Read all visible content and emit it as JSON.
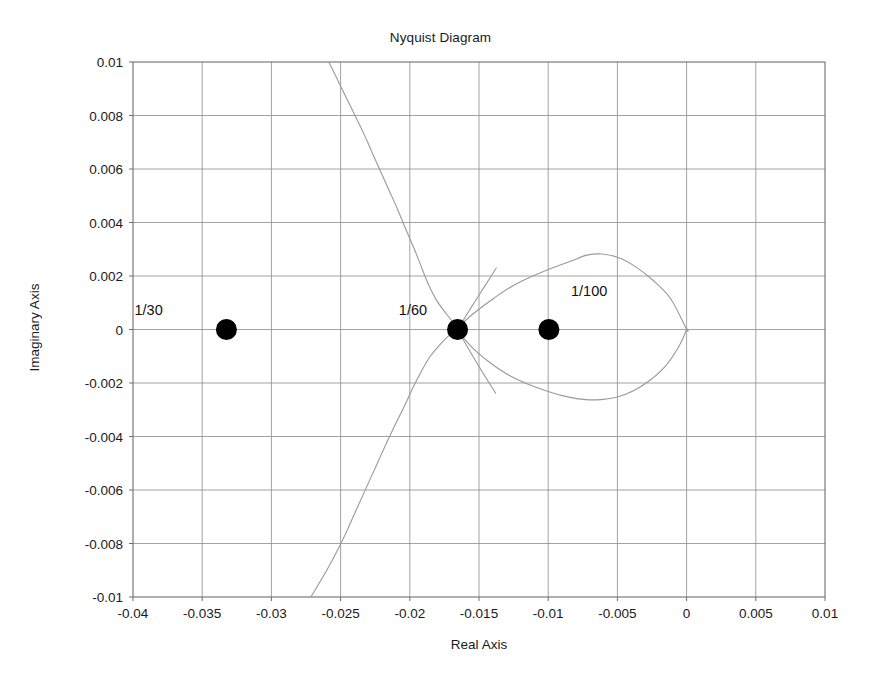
{
  "chart_data": {
    "type": "line",
    "title": "Nyquist Diagram",
    "xlabel": "Real Axis",
    "ylabel": "Imaginary Axis",
    "xlim": [
      -0.04,
      0.01
    ],
    "ylim": [
      -0.01,
      0.01
    ],
    "grid": true,
    "legend": "none",
    "xticks": [
      -0.04,
      -0.035,
      -0.03,
      -0.025,
      -0.02,
      -0.015,
      -0.01,
      -0.005,
      0,
      0.005,
      0.01
    ],
    "xtick_labels": [
      "-0.04",
      "-0.035",
      "-0.03",
      "-0.025",
      "-0.02",
      "-0.015",
      "-0.01",
      "-0.005",
      "0",
      "0.005",
      "0.01"
    ],
    "yticks": [
      0.01,
      0.008,
      0.006,
      0.004,
      0.002,
      0,
      -0.002,
      -0.004,
      -0.006,
      -0.008,
      -0.01
    ],
    "ytick_labels": [
      "0.01",
      "0.008",
      "0.006",
      "0.004",
      "0.002",
      "0",
      "-0.002",
      "-0.004",
      "-0.006",
      "-0.008",
      "-0.01"
    ],
    "line_color": "#999999",
    "marker_color": "#000000",
    "series": [
      {
        "name": "nyquist-loop",
        "closed": true,
        "points": [
          [
            0.0,
            0.0
          ],
          [
            -0.00115,
            0.00115
          ],
          [
            -0.00245,
            0.00185
          ],
          [
            -0.0037,
            0.00235
          ],
          [
            -0.0049,
            0.00268
          ],
          [
            -0.0061,
            0.00282
          ],
          [
            -0.0072,
            0.00278
          ],
          [
            -0.0084,
            0.00255
          ],
          [
            -0.0098,
            0.00228
          ],
          [
            -0.0112,
            0.00198
          ],
          [
            -0.0126,
            0.00162
          ],
          [
            -0.0139,
            0.00118
          ],
          [
            -0.0151,
            0.00072
          ],
          [
            -0.0161,
            0.00028
          ],
          [
            -0.01655,
            0.0
          ],
          [
            -0.0161,
            -0.00032
          ],
          [
            -0.0152,
            -0.00082
          ],
          [
            -0.0141,
            -0.00128
          ],
          [
            -0.0128,
            -0.00172
          ],
          [
            -0.0114,
            -0.00206
          ],
          [
            -0.01,
            -0.00232
          ],
          [
            -0.0086,
            -0.00252
          ],
          [
            -0.0073,
            -0.00262
          ],
          [
            -0.0062,
            -0.00262
          ],
          [
            -0.005,
            -0.00252
          ],
          [
            -0.0038,
            -0.00228
          ],
          [
            -0.0026,
            -0.00188
          ],
          [
            -0.00145,
            -0.00132
          ],
          [
            -0.0005,
            -0.00058
          ],
          [
            0.0,
            0.0
          ]
        ]
      },
      {
        "name": "nyquist-upper-branch",
        "closed": false,
        "points": [
          [
            -0.02585,
            0.01
          ],
          [
            -0.02495,
            0.00905
          ],
          [
            -0.0241,
            0.00815
          ],
          [
            -0.02335,
            0.00735
          ],
          [
            -0.02275,
            0.00665
          ],
          [
            -0.02215,
            0.00595
          ],
          [
            -0.02145,
            0.00515
          ],
          [
            -0.02085,
            0.00445
          ],
          [
            -0.02025,
            0.0037
          ],
          [
            -0.01965,
            0.00298
          ],
          [
            -0.01915,
            0.00232
          ],
          [
            -0.01865,
            0.00168
          ],
          [
            -0.01805,
            0.00108
          ],
          [
            -0.01735,
            0.00058
          ],
          [
            -0.01665,
            0.00012
          ],
          [
            -0.0163,
            -8e-05
          ]
        ]
      },
      {
        "name": "nyquist-lower-branch",
        "closed": false,
        "points": [
          [
            -0.02715,
            -0.01
          ],
          [
            -0.02605,
            -0.00905
          ],
          [
            -0.02515,
            -0.00818
          ],
          [
            -0.02445,
            -0.00742
          ],
          [
            -0.02385,
            -0.00672
          ],
          [
            -0.02315,
            -0.00592
          ],
          [
            -0.02245,
            -0.00512
          ],
          [
            -0.02175,
            -0.00432
          ],
          [
            -0.02105,
            -0.00355
          ],
          [
            -0.02035,
            -0.00282
          ],
          [
            -0.01975,
            -0.00215
          ],
          [
            -0.01915,
            -0.00155
          ],
          [
            -0.01855,
            -0.00102
          ],
          [
            -0.01785,
            -0.00058
          ],
          [
            -0.01715,
            -0.00022
          ],
          [
            -0.0165,
            0.0
          ]
        ]
      },
      {
        "name": "nyquist-loop-tail-upper",
        "closed": false,
        "points": [
          [
            -0.01655,
            0.0
          ],
          [
            -0.01545,
            0.00092
          ],
          [
            -0.01455,
            0.00165
          ],
          [
            -0.01375,
            0.0023
          ]
        ]
      },
      {
        "name": "nyquist-loop-tail-lower",
        "closed": false,
        "points": [
          [
            -0.01655,
            0.0
          ],
          [
            -0.0155,
            -0.00095
          ],
          [
            -0.0146,
            -0.00172
          ],
          [
            -0.0138,
            -0.00238
          ]
        ]
      }
    ],
    "markers": [
      {
        "label": "1/30",
        "x": -0.03325,
        "y": 0.0,
        "label_dx": -0.0046,
        "label_dy": 0.00055,
        "label_anchor": "end"
      },
      {
        "label": "1/60",
        "x": -0.01655,
        "y": 0.0,
        "label_dx": -0.0022,
        "label_dy": 0.00055,
        "label_anchor": "end"
      },
      {
        "label": "1/100",
        "x": -0.00995,
        "y": 0.0,
        "label_dx": 0.0016,
        "label_dy": 0.00125,
        "label_anchor": "start"
      }
    ]
  }
}
